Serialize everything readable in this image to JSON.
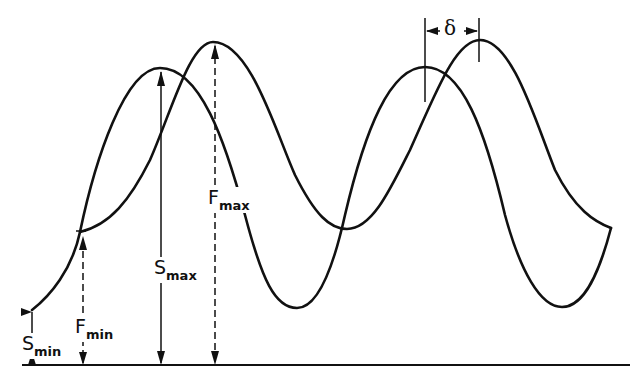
{
  "diagram": {
    "curves": [
      {
        "name": "S",
        "style": "solid",
        "min_label": "S",
        "min_sub": "min",
        "max_label": "S",
        "max_sub": "max"
      },
      {
        "name": "F",
        "style": "solid",
        "min_label": "F",
        "min_sub": "min",
        "max_label": "F",
        "max_sub": "max"
      }
    ],
    "labels": {
      "s_min": {
        "main": "S",
        "sub": "min"
      },
      "f_min": {
        "main": "F",
        "sub": "min"
      },
      "s_max": {
        "main": "S",
        "sub": "max"
      },
      "f_max": {
        "main": "F",
        "sub": "max"
      },
      "delta": "δ"
    },
    "colors": {
      "ink": "#111111",
      "background": "#ffffff"
    }
  }
}
